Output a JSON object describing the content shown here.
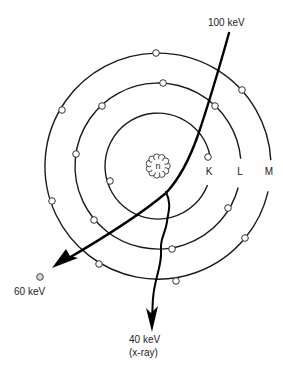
{
  "diagram": {
    "title": "",
    "nucleus": {
      "label": "n"
    },
    "shells": [
      {
        "label": "K",
        "electron_count": 2
      },
      {
        "label": "L",
        "electron_count": 7
      },
      {
        "label": "M",
        "electron_count": 7
      }
    ],
    "incident": {
      "label": "100 keV"
    },
    "scattered": {
      "label": "60 keV"
    },
    "xray": {
      "label": "40 keV",
      "sublabel": "(x-ray)"
    }
  }
}
